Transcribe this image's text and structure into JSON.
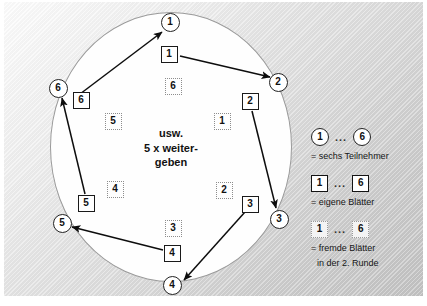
{
  "diagram": {
    "center_caption": {
      "line1": "usw.",
      "line2": "5 x weiter-",
      "line3": "geben"
    },
    "participants": [
      {
        "label": "1",
        "x": 170,
        "y": 22
      },
      {
        "label": "2",
        "x": 278,
        "y": 82
      },
      {
        "label": "3",
        "x": 279,
        "y": 219
      },
      {
        "label": "4",
        "x": 172,
        "y": 285
      },
      {
        "label": "5",
        "x": 62,
        "y": 223
      },
      {
        "label": "6",
        "x": 58,
        "y": 88
      }
    ],
    "own_sheets": [
      {
        "label": "1",
        "x": 169,
        "y": 54
      },
      {
        "label": "2",
        "x": 250,
        "y": 101
      },
      {
        "label": "3",
        "x": 250,
        "y": 204
      },
      {
        "label": "4",
        "x": 172,
        "y": 253
      },
      {
        "label": "5",
        "x": 86,
        "y": 203
      },
      {
        "label": "6",
        "x": 81,
        "y": 100
      }
    ],
    "foreign_sheets": [
      {
        "label": "6",
        "x": 173,
        "y": 86
      },
      {
        "label": "1",
        "x": 222,
        "y": 121
      },
      {
        "label": "2",
        "x": 224,
        "y": 190
      },
      {
        "label": "3",
        "x": 173,
        "y": 228
      },
      {
        "label": "4",
        "x": 115,
        "y": 189
      },
      {
        "label": "5",
        "x": 113,
        "y": 121
      }
    ],
    "arrows": [
      {
        "from_label": "6",
        "to_label": "1",
        "x1": 80,
        "y1": 94,
        "x2": 162,
        "y2": 32
      },
      {
        "from_label": "1",
        "to_label": "2",
        "x1": 180,
        "y1": 56,
        "x2": 270,
        "y2": 77
      },
      {
        "from_label": "2",
        "to_label": "3",
        "x1": 252,
        "y1": 111,
        "x2": 276,
        "y2": 208
      },
      {
        "from_label": "3",
        "to_label": "4",
        "x1": 245,
        "y1": 212,
        "x2": 184,
        "y2": 280
      },
      {
        "from_label": "4",
        "to_label": "5",
        "x1": 163,
        "y1": 250,
        "x2": 72,
        "y2": 227
      },
      {
        "from_label": "5",
        "to_label": "6",
        "x1": 85,
        "y1": 194,
        "x2": 62,
        "y2": 98
      }
    ]
  },
  "legend": {
    "dots": "...",
    "items": [
      {
        "kind": "circle",
        "first": "1",
        "last": "6",
        "caption": "= sechs Teilnehmer",
        "caption2": ""
      },
      {
        "kind": "own",
        "first": "1",
        "last": "6",
        "caption": "= eigene Blätter",
        "caption2": ""
      },
      {
        "kind": "foreign",
        "first": "1",
        "last": "6",
        "caption": "= fremde Blätter",
        "caption2": "in der 2. Runde"
      }
    ]
  },
  "colors": {
    "ink": "#111111",
    "circle_stroke": "#232323",
    "dotted_stroke": "#8d8d8d",
    "panel_light": "#fdfdfd",
    "panel_dark": "#c3c3c3",
    "field_fill": "#fefefe"
  }
}
